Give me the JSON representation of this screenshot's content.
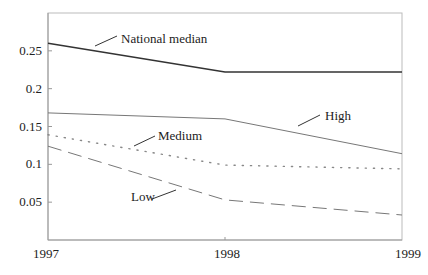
{
  "chart_data": {
    "type": "line",
    "title": "",
    "xlabel": "",
    "ylabel": "",
    "x": [
      "1997",
      "1998",
      "1999"
    ],
    "categories": [
      "1997",
      "1998",
      "1999"
    ],
    "ylim": [
      0,
      0.3
    ],
    "yticks": [
      0.05,
      0.1,
      0.15,
      0.2,
      0.25
    ],
    "ytick_labels": [
      "0.05",
      "0.1",
      "0.15",
      "0.2",
      "0.25"
    ],
    "grid": false,
    "legend": "inline-labels",
    "series": [
      {
        "name": "National median",
        "values": [
          0.26,
          0.222,
          0.222
        ],
        "style": "solid-thick",
        "color": "#333333"
      },
      {
        "name": "High",
        "values": [
          0.168,
          0.16,
          0.114
        ],
        "style": "solid-thin",
        "color": "#777777"
      },
      {
        "name": "Medium",
        "values": [
          0.139,
          0.099,
          0.094
        ],
        "style": "dotted",
        "color": "#888888"
      },
      {
        "name": "Low",
        "values": [
          0.124,
          0.053,
          0.033
        ],
        "style": "dashed",
        "color": "#777777"
      }
    ],
    "annotations": [
      {
        "text": "National median",
        "series": "National median"
      },
      {
        "text": "High",
        "series": "High"
      },
      {
        "text": "Medium",
        "series": "Medium"
      },
      {
        "text": "Low",
        "series": "Low"
      }
    ]
  },
  "layout": {
    "plot": {
      "left": 48,
      "right": 402,
      "top": 13,
      "bottom": 240
    },
    "label_positions": {
      "National median": {
        "x": 121,
        "y": 43,
        "leader": [
          95,
          46,
          117,
          36
        ]
      },
      "High": {
        "x": 325,
        "y": 120,
        "leader": [
          298,
          126,
          320,
          115
        ]
      },
      "Medium": {
        "x": 158,
        "y": 140,
        "leader": [
          134,
          146,
          155,
          136
        ]
      },
      "Low": {
        "x": 131,
        "y": 201,
        "leader": [
          152,
          199,
          176,
          190
        ]
      }
    }
  }
}
